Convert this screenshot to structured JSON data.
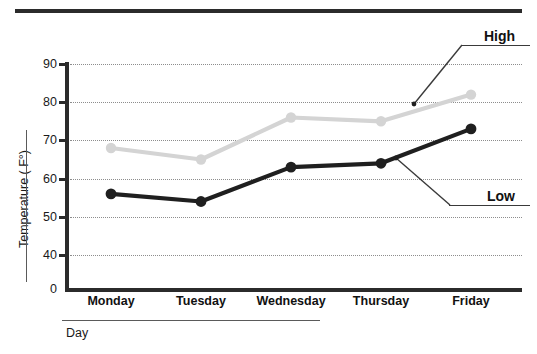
{
  "chart_data": {
    "type": "line",
    "title": "",
    "xlabel": "Day",
    "ylabel": "Temperature ( F°)",
    "categories": [
      "Monday",
      "Tuesday",
      "Wednesday",
      "Thursday",
      "Friday"
    ],
    "ylim": [
      40,
      90
    ],
    "yticks": [
      "90",
      "80",
      "70",
      "60",
      "50",
      "40",
      "0"
    ],
    "axis_break": true,
    "grid": true,
    "legend_position": "inline-callout",
    "series": [
      {
        "name": "High",
        "color": "#d4d4d4",
        "values": [
          68,
          65,
          76,
          75,
          82
        ]
      },
      {
        "name": "Low",
        "color": "#1f1f1f",
        "values": [
          56,
          54,
          63,
          64,
          73
        ]
      }
    ],
    "annotations": [
      {
        "text": "High",
        "target_series": "High",
        "position": "top-right"
      },
      {
        "text": "Low",
        "target_series": "Low",
        "position": "right-middle"
      }
    ]
  },
  "axes": {
    "y_tick_labels": [
      "90",
      "80",
      "70",
      "60",
      "50",
      "40",
      "0"
    ],
    "y_axis_title": "Temperature ( F°)",
    "x_tick_labels": [
      "Monday",
      "Tuesday",
      "Wednesday",
      "Thursday",
      "Friday"
    ],
    "x_axis_title": "Day"
  },
  "callouts": {
    "high_label": "High",
    "low_label": "Low"
  },
  "colors": {
    "high_series": "#d4d4d4",
    "low_series": "#1f1f1f",
    "axis": "#2b2b2b",
    "grid": "#8d8d8d",
    "text": "#1a1a1a"
  }
}
